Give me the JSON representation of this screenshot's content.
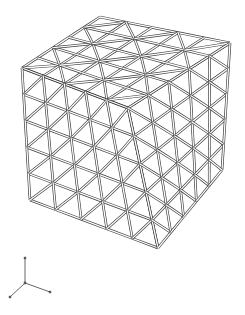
{
  "figure": {
    "cube": {
      "cells_per_edge": 5,
      "vertices": {
        "top_back": [
          100,
          17
        ],
        "top_left": [
          22,
          68
        ],
        "top_right": [
          230,
          43
        ],
        "top_front": [
          128,
          108
        ],
        "bottom_left": [
          30,
          200
        ],
        "bottom_front": [
          158,
          248
        ],
        "bottom_right": [
          222,
          170
        ]
      },
      "line_color": "#3a3a3a",
      "background": "#ffffff"
    },
    "axis_triad": {
      "origin": [
        25,
        283
      ],
      "axes": [
        {
          "name": "z",
          "end": [
            25,
            258
          ]
        },
        {
          "name": "x",
          "end": [
            50,
            292
          ]
        },
        {
          "name": "y",
          "end": [
            10,
            297
          ]
        }
      ],
      "color": "#555555"
    }
  }
}
